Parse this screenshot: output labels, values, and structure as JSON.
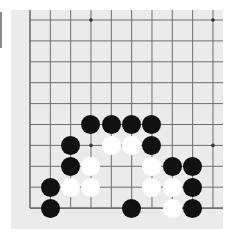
{
  "board": {
    "type": "go-board-fragment",
    "columns": 10,
    "rows": 10,
    "edges": [
      "left",
      "bottom"
    ],
    "colors": {
      "board": "#ebebeb",
      "line": "#6e6e6e",
      "black_stone": "#111111",
      "white_stone": "#ffffff"
    },
    "star_points": [
      {
        "col": 3,
        "row": 0
      },
      {
        "col": 9,
        "row": 0
      },
      {
        "col": 3,
        "row": 6
      },
      {
        "col": 9,
        "row": 6
      }
    ],
    "black_stones": [
      {
        "col": 3,
        "row": 5
      },
      {
        "col": 4,
        "row": 5
      },
      {
        "col": 5,
        "row": 5
      },
      {
        "col": 6,
        "row": 5
      },
      {
        "col": 2,
        "row": 6
      },
      {
        "col": 6,
        "row": 6
      },
      {
        "col": 2,
        "row": 7
      },
      {
        "col": 7,
        "row": 7
      },
      {
        "col": 8,
        "row": 7
      },
      {
        "col": 1,
        "row": 8
      },
      {
        "col": 8,
        "row": 8
      },
      {
        "col": 1,
        "row": 9
      },
      {
        "col": 5,
        "row": 9
      },
      {
        "col": 8,
        "row": 9
      }
    ],
    "white_stones": [
      {
        "col": 4,
        "row": 6
      },
      {
        "col": 5,
        "row": 6
      },
      {
        "col": 3,
        "row": 7
      },
      {
        "col": 6,
        "row": 7
      },
      {
        "col": 2,
        "row": 8
      },
      {
        "col": 3,
        "row": 8
      },
      {
        "col": 6,
        "row": 8
      },
      {
        "col": 7,
        "row": 8
      },
      {
        "col": 7,
        "row": 9
      }
    ]
  }
}
